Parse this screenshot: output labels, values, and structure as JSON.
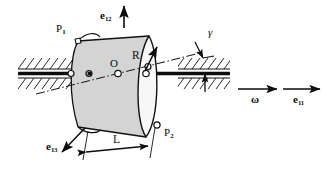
{
  "figure": {
    "type": "engineering-mechanics-diagram",
    "background": "#ffffff",
    "ink_color": "#0d0d0d"
  },
  "colors": {
    "cylinder_side": "#d4d4d4",
    "cylinder_face": "#f7f7f7",
    "outline": "#111111",
    "shaft": "#0d0d0d",
    "hatch": "#111111"
  },
  "labels": {
    "e12": {
      "base": "e",
      "sub": "12",
      "text": "e12"
    },
    "e11": {
      "base": "e",
      "sub": "11",
      "text": "e11"
    },
    "e13": {
      "base": "e",
      "sub": "13",
      "text": "e13"
    },
    "omega": {
      "text": "ω"
    },
    "gamma": {
      "text": "γ"
    },
    "radius": {
      "text": "R"
    },
    "length": {
      "text": "L"
    },
    "center": {
      "text": "O"
    },
    "p1": {
      "base": "P",
      "sub": "1",
      "text": "P1"
    },
    "p2": {
      "base": "P",
      "sub": "2",
      "text": "P2"
    }
  },
  "geometry": {
    "cylinder": {
      "radius_label": "R",
      "length_label": "L",
      "tilt_angle_label": "γ",
      "center_label": "O"
    },
    "markers": [
      {
        "name": "bearing-left-node",
        "label": ""
      },
      {
        "name": "rotor-left-node",
        "label": ""
      },
      {
        "name": "center-node",
        "label": "O"
      },
      {
        "name": "rotor-right-node",
        "label": ""
      },
      {
        "name": "bearing-right-node",
        "label": ""
      },
      {
        "name": "p1-node",
        "label": "P1"
      },
      {
        "name": "p2-node",
        "label": "P2"
      }
    ],
    "vectors": [
      {
        "name": "e12",
        "direction": "up"
      },
      {
        "name": "e13",
        "direction": "down-left"
      },
      {
        "name": "e11",
        "direction": "right"
      },
      {
        "name": "omega",
        "direction": "right"
      },
      {
        "name": "R",
        "direction": "up-right"
      }
    ],
    "supports": [
      {
        "name": "ground-hatch-left",
        "side": "left"
      },
      {
        "name": "ground-hatch-right",
        "side": "right"
      }
    ]
  }
}
